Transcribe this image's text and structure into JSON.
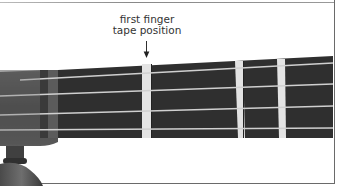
{
  "figure": {
    "label": {
      "line1": "first finger",
      "line2": "tape position"
    },
    "arrow_icon": "down-arrow",
    "colors": {
      "background": "#ffffff",
      "fingerboard": "#2e2e2e",
      "tape": "#e6e6e6",
      "string": "#cfcfcf",
      "text": "#333333"
    },
    "tapes_count": 3,
    "strings_count": 4
  }
}
